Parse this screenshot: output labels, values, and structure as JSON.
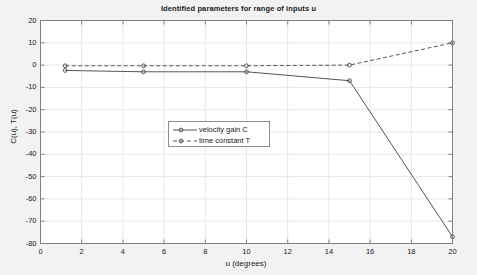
{
  "chart_data": {
    "type": "line",
    "title": "Identified parameters for range of inputs u",
    "xlabel": "u (degrees)",
    "ylabel": "C(u), T(u)",
    "xlim": [
      0,
      20
    ],
    "ylim": [
      -80,
      20
    ],
    "xticks": [
      0,
      2,
      4,
      6,
      8,
      10,
      12,
      14,
      16,
      18,
      20
    ],
    "yticks": [
      20,
      10,
      0,
      -10,
      -20,
      -30,
      -40,
      -50,
      -60,
      -70,
      -80
    ],
    "xtick_labels": [
      "0",
      "2",
      "4",
      "6",
      "8",
      "10",
      "12",
      "14",
      "16",
      "18",
      "20"
    ],
    "ytick_labels": [
      "20",
      "10",
      "0",
      "-10",
      "-20",
      "-30",
      "-40",
      "-50",
      "-60",
      "-70",
      "-80"
    ],
    "grid": true,
    "legend_position": "center-left",
    "series": [
      {
        "name": "velocity gain C",
        "style": "solid",
        "marker": "circle",
        "color": "#555555",
        "x": [
          1.2,
          5.0,
          10.0,
          15.0,
          20.0
        ],
        "values": [
          -2.4,
          -3.0,
          -3.0,
          -7.0,
          -77.0
        ]
      },
      {
        "name": "time constant T",
        "style": "dashed",
        "marker": "circle",
        "color": "#555555",
        "x": [
          1.2,
          5.0,
          10.0,
          15.0,
          20.0
        ],
        "values": [
          -0.3,
          -0.3,
          -0.3,
          0.0,
          10.0
        ]
      }
    ]
  },
  "legend": {
    "entries": [
      {
        "label": "velocity gain C"
      },
      {
        "label": "time constant T"
      }
    ]
  },
  "figure": {
    "background_color": "#f2f2f2",
    "axes_background_color": "#ffffff",
    "axis_color": "#808080",
    "grid_color": "#e6e6e6",
    "text_color": "#1a1a1a"
  }
}
